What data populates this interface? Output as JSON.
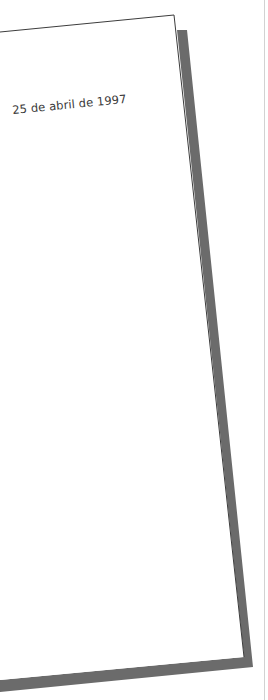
{
  "document": {
    "date": "25 de abril de 1997"
  },
  "colors": {
    "background": "#ffffff",
    "page": "#ffffff",
    "page_border": "#3c3c3c",
    "shadow": "#6b6b6b",
    "text": "#3a3a3a"
  }
}
